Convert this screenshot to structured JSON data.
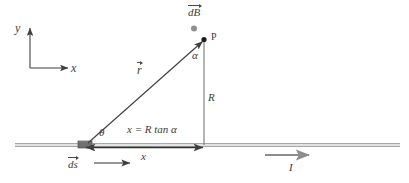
{
  "figure": {
    "type": "physics-diagram",
    "background_color": "#ffffff",
    "line_color": "#4a4a4a",
    "wire_color": "#9a9a9a",
    "element_color": "#6b6b6b",
    "text_color": "#3b3b3b"
  },
  "axes": {
    "y_label": "y",
    "x_label": "x",
    "origin": {
      "x": 30,
      "y": 68
    },
    "y_tip": {
      "x": 30,
      "y": 26
    },
    "x_tip": {
      "x": 70,
      "y": 68
    }
  },
  "labels": {
    "dB": {
      "text": "dB",
      "vector": true,
      "x": 188,
      "y": 8,
      "size": 11
    },
    "point_p": {
      "text": "P",
      "x": 211,
      "y": 33,
      "size": 10
    },
    "alpha": {
      "text": "α",
      "x": 193,
      "y": 52,
      "size": 11
    },
    "r": {
      "text": "r",
      "vector": true,
      "x": 138,
      "y": 66,
      "size": 12
    },
    "R": {
      "text": "R",
      "x": 209,
      "y": 93,
      "size": 11
    },
    "theta": {
      "text": "θ",
      "x": 99,
      "y": 128,
      "size": 11
    },
    "equation": {
      "text": "x = R tan α",
      "x": 127,
      "y": 125,
      "size": 11
    },
    "x_distance": {
      "text": "x",
      "x": 141,
      "y": 152,
      "size": 11
    },
    "ds": {
      "text": "ds",
      "vector": true,
      "x": 68,
      "y": 161,
      "size": 11
    },
    "current": {
      "text": "I",
      "x": 289,
      "y": 163,
      "size": 11
    }
  },
  "geometry": {
    "wire": {
      "x1": 15,
      "x2": 400,
      "y": 145,
      "thickness": 4
    },
    "current_element": {
      "x": 78,
      "y": 141,
      "width": 14,
      "height": 7
    },
    "r_vector": {
      "x1": 88,
      "y1": 143,
      "x2": 203,
      "y2": 41
    },
    "R_line": {
      "x": 204,
      "y1": 41,
      "y2": 145
    },
    "point_p_dot": {
      "x": 204,
      "y": 39,
      "radius": 2.6
    },
    "dB_dot": {
      "x": 194,
      "y": 28,
      "radius": 3.0
    },
    "x_arrow": {
      "x1": 85,
      "x2": 204,
      "y": 147
    },
    "ds_arrow": {
      "x1": 93,
      "x2": 130,
      "y": 163
    },
    "current_arrow": {
      "x1": 265,
      "x2": 310,
      "y": 155
    }
  }
}
